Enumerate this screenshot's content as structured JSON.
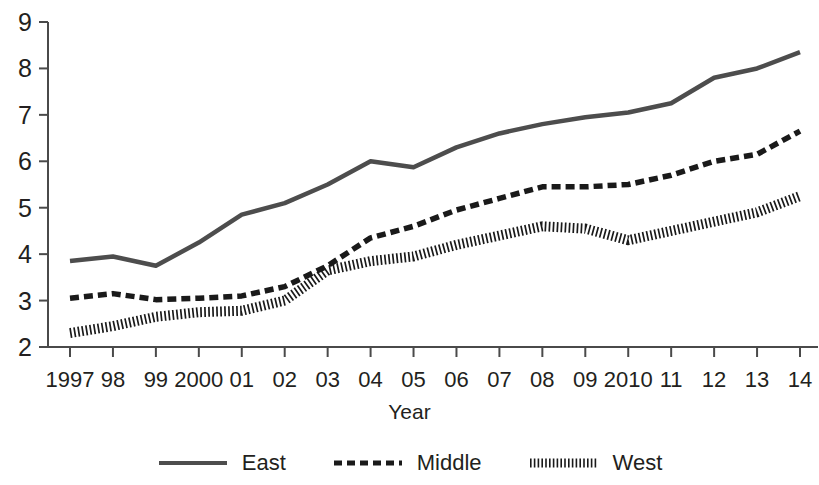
{
  "chart_data": {
    "type": "line",
    "title": "",
    "xlabel": "Year",
    "ylabel": "",
    "grid": false,
    "legend_position": "bottom",
    "xlim": [
      1997,
      2014
    ],
    "ylim": [
      2,
      9
    ],
    "yticks": [
      9,
      8,
      7,
      6,
      5,
      4,
      3,
      2
    ],
    "x": [
      1997,
      1998,
      1999,
      2000,
      2001,
      2002,
      2003,
      2004,
      2005,
      2006,
      2007,
      2008,
      2009,
      2010,
      2011,
      2012,
      2013,
      2014
    ],
    "categories": [
      "1997",
      "98",
      "99",
      "2000",
      "01",
      "02",
      "03",
      "04",
      "05",
      "06",
      "07",
      "08",
      "09",
      "2010",
      "11",
      "12",
      "13",
      "14"
    ],
    "series": [
      {
        "name": "East",
        "style": "solid",
        "color": "#4d4d4d",
        "values": [
          3.85,
          3.95,
          3.75,
          4.25,
          4.85,
          5.1,
          5.5,
          6.0,
          5.87,
          6.3,
          6.6,
          6.8,
          6.95,
          7.05,
          7.25,
          7.8,
          8.0,
          8.35
        ]
      },
      {
        "name": "Middle",
        "style": "dashed",
        "color": "#1a1a1a",
        "values": [
          3.05,
          3.15,
          3.02,
          3.05,
          3.1,
          3.3,
          3.75,
          4.35,
          4.6,
          4.95,
          5.2,
          5.45,
          5.45,
          5.5,
          5.7,
          6.0,
          6.15,
          6.65
        ]
      },
      {
        "name": "West",
        "style": "fine-dashed",
        "color": "#1a1a1a",
        "values": [
          2.3,
          2.45,
          2.65,
          2.75,
          2.78,
          3.0,
          3.65,
          3.85,
          3.95,
          4.2,
          4.4,
          4.6,
          4.55,
          4.3,
          4.5,
          4.7,
          4.9,
          5.25
        ]
      }
    ]
  },
  "axis": {
    "x_title": "Year"
  },
  "legend": {
    "entries": [
      {
        "label": "East"
      },
      {
        "label": "Middle"
      },
      {
        "label": "West"
      }
    ]
  }
}
